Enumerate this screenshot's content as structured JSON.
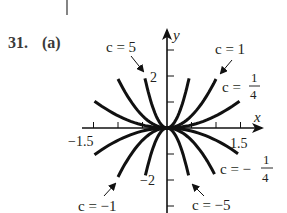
{
  "problem": {
    "number": "31.",
    "part": "(a)"
  },
  "chart_data": {
    "type": "line",
    "title": "",
    "function_family": "y = c·x²",
    "xlabel": "x",
    "ylabel": "y",
    "xlim": [
      -1.5,
      1.5
    ],
    "ylim": [
      -3,
      3
    ],
    "x_tick_step": 0.5,
    "y_tick_step": 1,
    "x_tick_labels": [
      "-1.5",
      "1.5"
    ],
    "y_tick_labels": [
      "2",
      "-2"
    ],
    "grid": false,
    "series": [
      {
        "name": "c = 5",
        "c": 5,
        "x_range": [
          -0.45,
          0.45
        ]
      },
      {
        "name": "c = 1",
        "c": 1,
        "x_range": [
          -1.0,
          1.0
        ]
      },
      {
        "name": "c = 1/4",
        "c": 0.25,
        "x_range": [
          -1.48,
          1.48
        ]
      },
      {
        "name": "c = -1/4",
        "c": -0.25,
        "x_range": [
          -1.48,
          1.45
        ]
      },
      {
        "name": "c = -1",
        "c": -1,
        "x_range": [
          -1.0,
          0.97
        ]
      },
      {
        "name": "c = -5",
        "c": -5,
        "x_range": [
          -0.44,
          0.44
        ]
      }
    ]
  },
  "labels": {
    "x_axis": "x",
    "y_axis": "y",
    "x_neg": "−1.5",
    "x_pos": "1.5",
    "y_pos": "2",
    "y_neg": "−2",
    "c5": "c = 5",
    "c1": "c = 1",
    "c_quarter_prefix": "c =",
    "c_quarter_num": "1",
    "c_quarter_den": "4",
    "c_negquarter_prefix": "c = −",
    "c_negquarter_num": "1",
    "c_negquarter_den": "4",
    "cneg1": "c = −1",
    "cneg5": "c = −5"
  },
  "colors": {
    "ink": "#111111",
    "text": "#231f20",
    "problem_number": "#3a3a3a"
  }
}
